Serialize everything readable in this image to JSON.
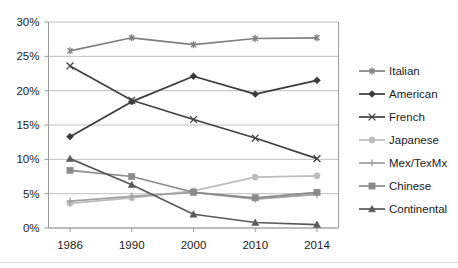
{
  "chart_data": {
    "type": "line",
    "title": "",
    "subtitle": "",
    "xlabel": "",
    "ylabel": "",
    "categories": [
      "1986",
      "1990",
      "2000",
      "2010",
      "2014"
    ],
    "x_tick_labels": [
      "1986",
      "1990",
      "2000",
      "2010",
      "2014"
    ],
    "y_tick_labels": [
      "0%",
      "5%",
      "10%",
      "15%",
      "20%",
      "25%",
      "30%"
    ],
    "y_tick_values": [
      0,
      5,
      10,
      15,
      20,
      25,
      30
    ],
    "ylim": [
      0,
      30
    ],
    "grid": "horizontal",
    "legend_position": "right",
    "value_suffix": "%",
    "series": [
      {
        "name": "Italian",
        "marker": "asterisk",
        "color": "#7f7f7f",
        "values": [
          25.8,
          27.7,
          26.7,
          27.6,
          27.7
        ]
      },
      {
        "name": "American",
        "marker": "diamond",
        "color": "#3a3a3a",
        "values": [
          13.3,
          18.4,
          22.1,
          19.5,
          21.5
        ]
      },
      {
        "name": "French",
        "marker": "cross",
        "color": "#404040",
        "values": [
          23.6,
          18.6,
          15.8,
          13.1,
          10.1
        ]
      },
      {
        "name": "Japanese",
        "marker": "circle",
        "color": "#bdbdbd",
        "values": [
          3.6,
          4.4,
          5.4,
          7.4,
          7.6
        ]
      },
      {
        "name": "Mex/TexMx",
        "marker": "plus",
        "color": "#a0a0a0",
        "values": [
          3.9,
          4.6,
          5.2,
          4.2,
          4.9
        ]
      },
      {
        "name": "Chinese",
        "marker": "square",
        "color": "#8a8a8a",
        "values": [
          8.4,
          7.5,
          5.2,
          4.4,
          5.2
        ]
      },
      {
        "name": "Continental",
        "marker": "triangle",
        "color": "#5a5a5a",
        "values": [
          10.1,
          6.3,
          2.0,
          0.8,
          0.5
        ]
      }
    ]
  },
  "legend": {
    "items": [
      {
        "label": "Italian"
      },
      {
        "label": "American"
      },
      {
        "label": "French"
      },
      {
        "label": "Japanese"
      },
      {
        "label": "Mex/TexMx"
      },
      {
        "label": "Chinese"
      },
      {
        "label": "Continental"
      }
    ]
  },
  "colors": {
    "background": "#ffffff",
    "gridline": "#b8b8b8",
    "axis": "#9a9a9a",
    "text": "#1a1a1a"
  }
}
